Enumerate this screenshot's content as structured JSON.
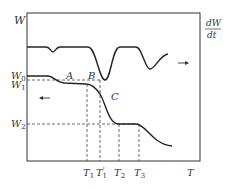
{
  "diagram": {
    "type": "thermogravimetric-analysis",
    "frame": {
      "x": 27,
      "y": 13,
      "width": 173,
      "height": 148
    },
    "colors": {
      "stroke": "#333333",
      "background": "#ffffff"
    },
    "y_axis": {
      "left_label": "W",
      "right_label_numerator": "dW",
      "right_label_denominator": "dt"
    },
    "x_axis": {
      "label": "T"
    },
    "weight_levels": [
      {
        "name": "W",
        "sub": "0",
        "y": 76
      },
      {
        "name": "W",
        "sub": "1",
        "y": 80
      },
      {
        "name": "W",
        "sub": "2",
        "y": 124
      }
    ],
    "temperature_ticks": [
      {
        "name": "T",
        "sub": "1",
        "prime": "",
        "x": 87
      },
      {
        "name": "T",
        "sub": "1",
        "prime": "'",
        "x": 100
      },
      {
        "name": "T",
        "sub": "2",
        "prime": "",
        "x": 119
      },
      {
        "name": "T",
        "sub": "3",
        "prime": "",
        "x": 139
      }
    ],
    "point_labels": [
      {
        "text": "A",
        "x": 66,
        "y": 79
      },
      {
        "text": "B",
        "x": 87,
        "y": 79
      },
      {
        "text": "C",
        "x": 111,
        "y": 100
      }
    ],
    "curves": {
      "dtg": "M27,47 L46,47 C50,47 51,52 53,52 C55,52 56,47 60,47 L88,47 C96,47 99,80 105,80 C111,80 112,47 120,47 L136,47 C142,47 145,69 150,69 C155,69 160,55 168,54",
      "tg": "M27,76 L48,76 C54,76 55,82 64,83 L86,84 C92,84 96,88 100,94 C106,104 108,122 118,124 L136,124 C146,124 152,144 172,146"
    },
    "arrows": [
      {
        "direction": "right",
        "curve": "dtg",
        "x": 184,
        "y": 63
      },
      {
        "direction": "left",
        "curve": "tg",
        "x": 43,
        "y": 98
      }
    ]
  }
}
